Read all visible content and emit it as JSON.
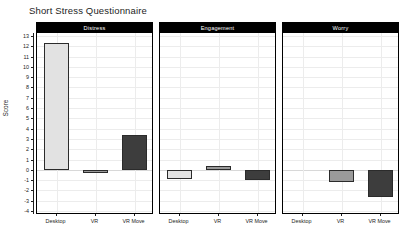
{
  "chart_data": {
    "type": "bar",
    "title": "Short Stress Questionnaire",
    "xlabel": "",
    "ylabel": "Score",
    "ylim": [
      -4,
      13
    ],
    "yticks": [
      13,
      12,
      11,
      10,
      9,
      8,
      7,
      6,
      5,
      4,
      3,
      2,
      1,
      0,
      -1,
      -2,
      -3,
      -4
    ],
    "grid": true,
    "legend": "none",
    "categories": [
      "Desktop",
      "VR",
      "VR Move"
    ],
    "panels": [
      {
        "label": "Distress",
        "values": [
          12.3,
          -0.35,
          3.4
        ]
      },
      {
        "label": "Engagement",
        "values": [
          -0.85,
          0.35,
          -1.0
        ]
      },
      {
        "label": "Worry",
        "values": [
          0,
          -1.2,
          -2.6
        ]
      }
    ],
    "series_colors": {
      "Desktop": "#e2e2e2",
      "VR": "#9a9a9a",
      "VR Move": "#3d3d3d"
    },
    "bar_edge_color": "#2b2b2b",
    "panel_strip_color": "#000000",
    "panel_strip_text_color": "#ffffff",
    "background_color": "#ffffff",
    "grid_color": "#ececec"
  }
}
